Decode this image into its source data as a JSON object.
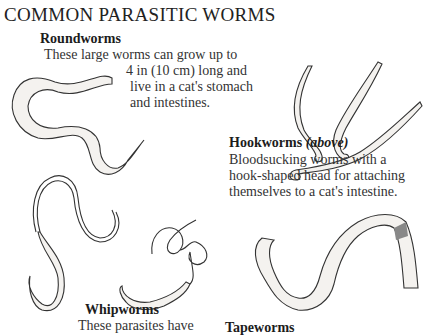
{
  "title": "COMMON PARASITIC WORMS",
  "sections": {
    "roundworms": {
      "heading": "Roundworms",
      "lines": [
        "These large worms can grow up to",
        "4 in (10 cm) long and",
        "live in a cat's stomach",
        "and intestines."
      ]
    },
    "hookworms": {
      "heading": "Hookworms",
      "heading_suffix": "(above)",
      "lines": [
        "Bloodsucking worms with a",
        "hook-shaped head for attaching",
        "themselves to a cat's intestine."
      ]
    },
    "whipworms": {
      "heading": "Whipworms",
      "lines": [
        "These parasites have"
      ]
    },
    "tapeworms": {
      "heading": "Tapeworms"
    }
  },
  "illustrations": [
    "roundworm-illustration",
    "hookworm-illustration",
    "whipworm-illustration",
    "tapeworm-illustration"
  ]
}
